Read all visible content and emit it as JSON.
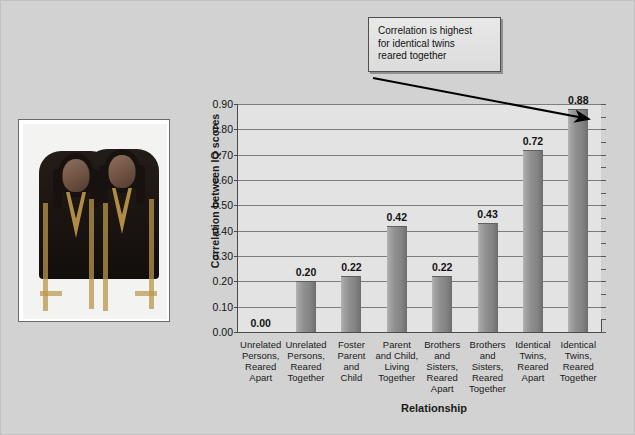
{
  "figure": {
    "background_color": "#d2d2d2",
    "plot_background_color": "#e3e3e3",
    "bar_color": "#8f8f8f"
  },
  "photo": {
    "name": "identical-twins-photograph",
    "alt": "Photograph of two identical twin girls wearing dark embroidered dresses"
  },
  "callout": {
    "line1": "Correlation is highest",
    "line2": "for identical twins",
    "line3": "reared together"
  },
  "chart_data": {
    "type": "bar",
    "title": "",
    "xlabel": "Relationship",
    "ylabel": "Correlation between IQ scores",
    "ylim": [
      0.0,
      0.9
    ],
    "ytick_labels": [
      "0.90",
      "0.80",
      "0.70",
      "0.60",
      "0.50",
      "0.40",
      "0.30",
      "0.20",
      "0.10",
      "0.00"
    ],
    "ytick_values": [
      0.9,
      0.8,
      0.7,
      0.6,
      0.5,
      0.4,
      0.3,
      0.2,
      0.1,
      0.0
    ],
    "grid": true,
    "legend": "none",
    "categories": [
      "Unrelated\nPersons,\nReared\nApart",
      "Unrelated\nPersons,\nReared\nTogether",
      "Foster\nParent\nand\nChild",
      "Parent\nand Child,\nLiving\nTogether",
      "Brothers\nand\nSisters,\nReared\nApart",
      "Brothers\nand\nSisters,\nReared\nTogether",
      "Identical\nTwins,\nReared\nApart",
      "Identical\nTwins,\nReared\nTogether"
    ],
    "values": [
      0.0,
      0.2,
      0.22,
      0.42,
      0.22,
      0.43,
      0.72,
      0.88
    ],
    "value_labels": [
      "0.00",
      "0.20",
      "0.22",
      "0.42",
      "0.22",
      "0.43",
      "0.72",
      "0.88"
    ],
    "annotations": [
      {
        "text": "Correlation is highest for identical twins reared together",
        "points_to_category": "Identical Twins, Reared Together",
        "points_to_value": 0.88
      }
    ]
  }
}
